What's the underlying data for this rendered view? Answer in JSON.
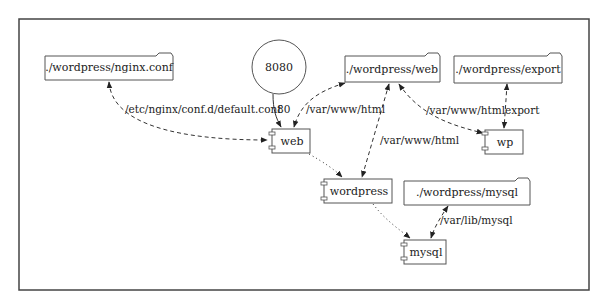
{
  "diagram": {
    "type": "docker-compose deployment graph",
    "frame": {
      "x": 19,
      "y": 19,
      "width": 570,
      "height": 271,
      "stroke": "#444444"
    },
    "colors": {
      "line": "#333333",
      "node_stroke": "#555555",
      "text": "#222222",
      "background": "#ffffff"
    },
    "nodes": {
      "nginx_conf": {
        "label": "./wordpress/nginx.conf",
        "kind": "folder"
      },
      "port_8080": {
        "label": "8080",
        "kind": "circle"
      },
      "web_folder": {
        "label": "./wordpress/web",
        "kind": "folder"
      },
      "export_folder": {
        "label": "./wordpress/export",
        "kind": "folder"
      },
      "web": {
        "label": "web",
        "kind": "component"
      },
      "wp": {
        "label": "wp",
        "kind": "component"
      },
      "wordpress": {
        "label": "wordpress",
        "kind": "component"
      },
      "mysql_folder": {
        "label": "./wordpress/mysql",
        "kind": "folder"
      },
      "mysql": {
        "label": "mysql",
        "kind": "component"
      }
    },
    "edges": [
      {
        "from": "nginx_conf",
        "to": "web",
        "style": "dashed",
        "arrows": "both",
        "label": "/etc/nginx/conf.d/default.conf"
      },
      {
        "from": "port_8080",
        "to": "web",
        "style": "solid",
        "arrows": "end",
        "label": "80"
      },
      {
        "from": "web_folder",
        "to": "web",
        "style": "dashed",
        "arrows": "both",
        "label": "/var/www/html"
      },
      {
        "from": "web_folder",
        "to": "wordpress",
        "style": "dashed",
        "arrows": "both",
        "label": "/var/www/html"
      },
      {
        "from": "web_folder",
        "to": "wp",
        "style": "dashed",
        "arrows": "both",
        "label": "/var/www/html"
      },
      {
        "from": "export_folder",
        "to": "wp",
        "style": "dashed",
        "arrows": "both",
        "label": "export"
      },
      {
        "from": "web",
        "to": "wordpress",
        "style": "dotted",
        "arrows": "end",
        "label": ""
      },
      {
        "from": "wordpress",
        "to": "mysql",
        "style": "dotted",
        "arrows": "end",
        "label": ""
      },
      {
        "from": "mysql_folder",
        "to": "mysql",
        "style": "dashed",
        "arrows": "both",
        "label": "/var/lib/mysql"
      }
    ]
  }
}
